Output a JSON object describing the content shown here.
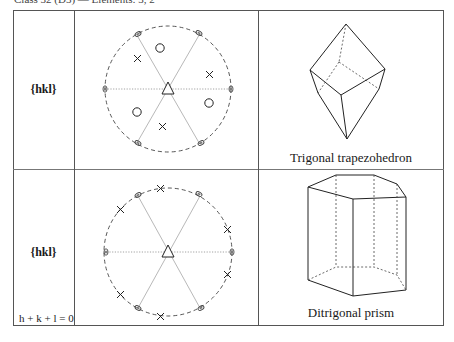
{
  "header": {
    "title": "Class 32 (D3) — Elements: 3, 2"
  },
  "rows": [
    {
      "form": "{hkl}",
      "condition": "",
      "stereogram": {
        "center": [
          168,
          89
        ],
        "radius": 63,
        "symbols": {
          "crosses": [
            [
              132,
              59
            ],
            [
              210,
              76
            ],
            [
              162,
              128
            ]
          ],
          "circles": [
            [
              159,
              48
            ],
            [
              208,
              102
            ],
            [
              137,
              112
            ]
          ],
          "twofold_axes_angles_deg": [
            0,
            60,
            120,
            180,
            240,
            300
          ],
          "threefold_center": "triangle"
        }
      },
      "crystal": {
        "name": "Trigonal trapezohedron"
      }
    },
    {
      "form": "{hkl}",
      "condition": "h + k + l = 0",
      "stereogram": {
        "center": [
          168,
          252
        ],
        "radius": 64,
        "symbols": {
          "crosses_on_primitive_angles_deg": [
            -80,
            -140,
            160,
            100,
            40,
            -20
          ],
          "twofold_axes_angles_deg": [
            0,
            60,
            120,
            180,
            240,
            300
          ],
          "threefold_center": "triangle"
        }
      },
      "crystal": {
        "name": "Ditrigonal prism"
      }
    }
  ],
  "colors": {
    "line": "#333333",
    "dotted": "#8a8a8a",
    "border": "#555555"
  }
}
